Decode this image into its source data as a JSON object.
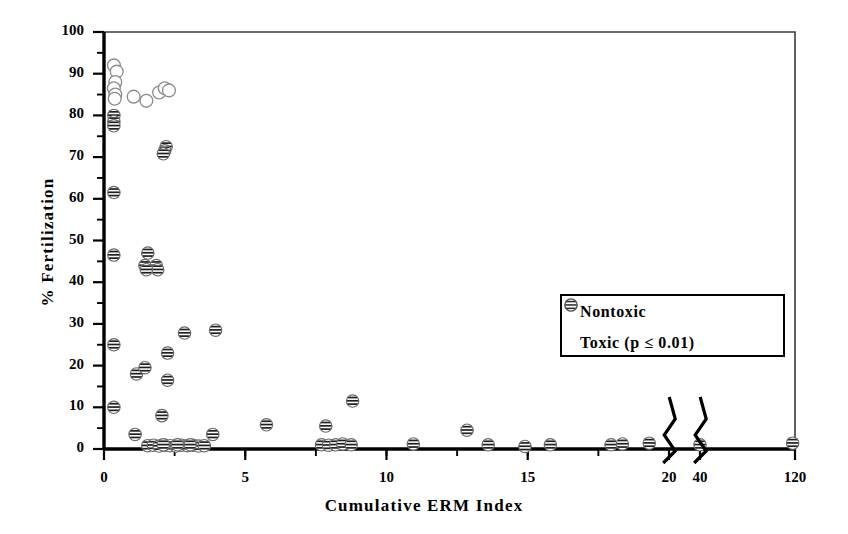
{
  "chart_data": {
    "type": "scatter",
    "title": "",
    "xlabel": "Cumulative ERM Index",
    "ylabel": "% Fertilization",
    "xlim": [
      0,
      120
    ],
    "ylim": [
      0,
      100
    ],
    "grid": false,
    "axis_breaks": [
      20.8,
      41
    ],
    "x_ticks": [
      0,
      5,
      10,
      15,
      20,
      40,
      120
    ],
    "x_tick_labels": [
      "0",
      "5",
      "10",
      "15",
      "20",
      "40",
      "120"
    ],
    "x_minor_tick_step": 2.5,
    "y_ticks": [
      0,
      10,
      20,
      30,
      40,
      50,
      60,
      70,
      80,
      90,
      100
    ],
    "y_tick_labels": [
      "0",
      "10",
      "20",
      "30",
      "40",
      "50",
      "60",
      "70",
      "80",
      "90",
      "100"
    ],
    "y_minor_tick_step": 5,
    "legend_position": "center-right",
    "series": [
      {
        "name": "Nontoxic",
        "marker": "open-circle",
        "points": [
          [
            0.35,
            92.0
          ],
          [
            0.45,
            90.5
          ],
          [
            0.4,
            88.0
          ],
          [
            0.35,
            86.5
          ],
          [
            0.4,
            85.0
          ],
          [
            0.38,
            84.0
          ],
          [
            1.05,
            84.5
          ],
          [
            1.5,
            83.5
          ],
          [
            1.95,
            85.5
          ],
          [
            2.15,
            86.5
          ],
          [
            2.3,
            86.0
          ]
        ]
      },
      {
        "name": "Toxic (p ≤ 0.01)",
        "marker": "striped-circle",
        "points": [
          [
            0.35,
            80.0
          ],
          [
            0.35,
            78.5
          ],
          [
            0.35,
            77.5
          ],
          [
            2.2,
            72.5
          ],
          [
            2.15,
            71.5
          ],
          [
            2.1,
            70.8
          ],
          [
            0.35,
            61.5
          ],
          [
            0.35,
            46.5
          ],
          [
            1.55,
            47.0
          ],
          [
            1.45,
            44.0
          ],
          [
            1.85,
            44.0
          ],
          [
            1.9,
            43.0
          ],
          [
            1.5,
            43.0
          ],
          [
            0.35,
            25.0
          ],
          [
            2.25,
            23.0
          ],
          [
            2.85,
            27.8
          ],
          [
            3.95,
            28.5
          ],
          [
            1.15,
            18.0
          ],
          [
            1.45,
            19.5
          ],
          [
            2.25,
            16.5
          ],
          [
            0.35,
            10.0
          ],
          [
            8.8,
            11.5
          ],
          [
            2.05,
            8.0
          ],
          [
            1.1,
            3.5
          ],
          [
            3.85,
            3.5
          ],
          [
            5.75,
            5.8
          ],
          [
            7.85,
            5.5
          ],
          [
            12.85,
            4.5
          ],
          [
            1.55,
            0.8
          ],
          [
            1.75,
            0.9
          ],
          [
            1.95,
            0.7
          ],
          [
            2.15,
            0.9
          ],
          [
            2.35,
            0.8
          ],
          [
            2.55,
            0.7
          ],
          [
            2.75,
            0.9
          ],
          [
            2.95,
            0.8
          ],
          [
            3.15,
            0.9
          ],
          [
            3.35,
            0.7
          ],
          [
            3.55,
            0.8
          ],
          [
            2.1,
            1.0
          ],
          [
            2.6,
            1.0
          ],
          [
            3.05,
            1.0
          ],
          [
            7.7,
            1.0
          ],
          [
            7.95,
            0.9
          ],
          [
            8.2,
            1.0
          ],
          [
            8.45,
            1.2
          ],
          [
            8.75,
            1.0
          ],
          [
            10.95,
            1.2
          ],
          [
            13.6,
            1.0
          ],
          [
            14.9,
            0.6
          ],
          [
            15.8,
            1.0
          ],
          [
            17.95,
            1.0
          ],
          [
            18.35,
            1.2
          ],
          [
            19.3,
            1.4
          ],
          [
            40.0,
            1.0
          ],
          [
            118.0,
            1.4
          ]
        ]
      }
    ]
  },
  "legend": {
    "items": [
      {
        "label": "Nontoxic",
        "marker": "open-circle"
      },
      {
        "label": "Toxic (p ≤ 0.01)",
        "marker": "striped-circle"
      }
    ]
  }
}
